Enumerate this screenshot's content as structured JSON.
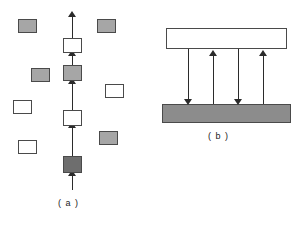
{
  "figure": {
    "background_color": "#ffffff",
    "line_color": "#2b2b2b",
    "border_color": "#4a4a4a",
    "panels": [
      {
        "id": "a",
        "caption": "( a )",
        "description": "vertical chain of alternating white and shaded boxes linked by upward arrows, surrounded by scattered free boxes",
        "chain": {
          "direction": "upward",
          "nodes": [
            {
              "name": "chain-node-1",
              "fill": "white",
              "shade": "#ffffff",
              "x": 63,
              "y": 38,
              "w": 19,
              "h": 15
            },
            {
              "name": "chain-node-2",
              "fill": "gray",
              "shade": "#a6a6a6",
              "x": 63,
              "y": 65,
              "w": 19,
              "h": 16
            },
            {
              "name": "chain-node-3",
              "fill": "white",
              "shade": "#ffffff",
              "x": 63,
              "y": 110,
              "w": 19,
              "h": 16
            },
            {
              "name": "chain-node-4",
              "fill": "dark",
              "shade": "#6e6e6e",
              "x": 63,
              "y": 156,
              "w": 19,
              "h": 17
            }
          ],
          "arrow_count": 5,
          "top_y": 14,
          "bottom_y": 190
        },
        "scattered_nodes": [
          {
            "name": "free-node-left-1",
            "fill": "gray",
            "shade": "#a6a6a6",
            "x": 18,
            "y": 19,
            "w": 19,
            "h": 14
          },
          {
            "name": "free-node-left-2",
            "fill": "gray",
            "shade": "#a6a6a6",
            "x": 31,
            "y": 68,
            "w": 19,
            "h": 14
          },
          {
            "name": "free-node-left-3",
            "fill": "white",
            "shade": "#ffffff",
            "x": 13,
            "y": 100,
            "w": 19,
            "h": 14
          },
          {
            "name": "free-node-left-4",
            "fill": "white",
            "shade": "#ffffff",
            "x": 18,
            "y": 140,
            "w": 19,
            "h": 14
          },
          {
            "name": "free-node-right-1",
            "fill": "gray",
            "shade": "#a6a6a6",
            "x": 97,
            "y": 19,
            "w": 19,
            "h": 14
          },
          {
            "name": "free-node-right-2",
            "fill": "white",
            "shade": "#ffffff",
            "x": 105,
            "y": 84,
            "w": 19,
            "h": 14
          },
          {
            "name": "free-node-right-3",
            "fill": "gray",
            "shade": "#a6a6a6",
            "x": 99,
            "y": 131,
            "w": 19,
            "h": 14
          }
        ]
      },
      {
        "id": "b",
        "caption": "( b )",
        "description": "white bar above a shaded bar connected by four vertical arrows alternating downward and upward",
        "bars": [
          {
            "name": "bar-top",
            "label": "",
            "fill": "white",
            "shade": "#ffffff",
            "x": 16,
            "y": 28,
            "w": 121,
            "h": 21
          },
          {
            "name": "bar-bottom",
            "label": "",
            "fill": "shaded",
            "shade": "#8c8c8c",
            "x": 12,
            "y": 104,
            "w": 129,
            "h": 19
          }
        ],
        "arrows": [
          {
            "name": "flow-arrow-1",
            "direction": "down",
            "x": 38
          },
          {
            "name": "flow-arrow-2",
            "direction": "up",
            "x": 63
          },
          {
            "name": "flow-arrow-3",
            "direction": "down",
            "x": 88
          },
          {
            "name": "flow-arrow-4",
            "direction": "up",
            "x": 113
          }
        ]
      }
    ]
  }
}
